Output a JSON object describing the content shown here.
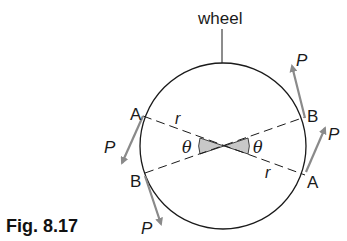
{
  "figure": {
    "caption": "Fig. 8.17",
    "wheel_label": "wheel",
    "points": {
      "left_top": "A",
      "left_bottom": "B",
      "right_top": "B",
      "right_bottom": "A"
    },
    "radius_label": "r",
    "angle_label": "θ",
    "force_label": "P",
    "colors": {
      "line": "#1a1a1a",
      "arrow": "#8a8a8a",
      "angle_fill": "#c8c8c8"
    }
  }
}
